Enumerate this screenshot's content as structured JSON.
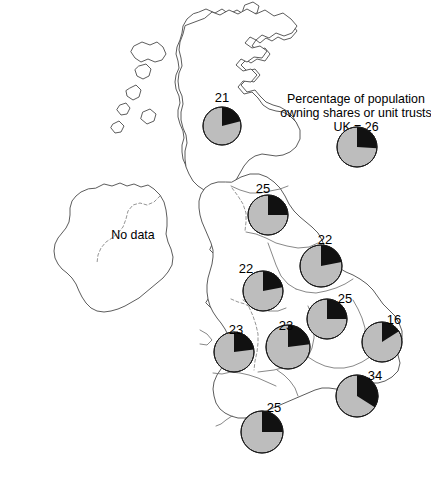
{
  "figure": {
    "title_line1": "Percentage of population",
    "title_line2": "owning shares or unit trusts",
    "title_line3": "UK = 26",
    "no_data_label": "No data",
    "colors": {
      "owners_wedge": "#111111",
      "non_owners_wedge": "#bdbdbd",
      "coastline": "#4a4a4a",
      "region_boundary": "#6a6a6a",
      "background": "#ffffff"
    }
  },
  "chart_data": {
    "type": "pie",
    "title": "Percentage of population owning shares or unit trusts",
    "subtitle": "UK = 26",
    "value_unit": "percent",
    "series_name": "Owning shares or unit trusts",
    "categories": [
      "Owning shares or unit trusts",
      "Not owning"
    ],
    "national_reference": {
      "name": "UK",
      "value": 26,
      "remainder": 74,
      "label": "UK = 26"
    },
    "regions": [
      {
        "name": "Scotland",
        "value": 21,
        "remainder": 79,
        "label": "21",
        "cx": 222,
        "cy": 126,
        "r": 19,
        "label_x": 222,
        "label_y": 102
      },
      {
        "name": "North East",
        "value": 25,
        "remainder": 75,
        "label": "25",
        "cx": 268,
        "cy": 215,
        "r": 20,
        "label_x": 263,
        "label_y": 193
      },
      {
        "name": "Yorkshire and the Humber",
        "value": 22,
        "remainder": 78,
        "label": "22",
        "cx": 321,
        "cy": 266,
        "r": 21,
        "label_x": 325,
        "label_y": 244
      },
      {
        "name": "North West",
        "value": 22,
        "remainder": 78,
        "label": "22",
        "cx": 263,
        "cy": 291,
        "r": 20,
        "label_x": 246,
        "label_y": 273
      },
      {
        "name": "East Midlands",
        "value": 25,
        "remainder": 75,
        "label": "25",
        "cx": 327,
        "cy": 319,
        "r": 20,
        "label_x": 345,
        "label_y": 303
      },
      {
        "name": "East of England",
        "value": 16,
        "remainder": 84,
        "label": "16",
        "cx": 382,
        "cy": 342,
        "r": 20,
        "label_x": 394,
        "label_y": 324
      },
      {
        "name": "Wales",
        "value": 23,
        "remainder": 77,
        "label": "23",
        "cx": 234,
        "cy": 352,
        "r": 20,
        "label_x": 236,
        "label_y": 334
      },
      {
        "name": "West Midlands",
        "value": 23,
        "remainder": 77,
        "label": "23",
        "cx": 288,
        "cy": 347,
        "r": 22,
        "label_x": 286,
        "label_y": 330
      },
      {
        "name": "London and South East",
        "value": 34,
        "remainder": 66,
        "label": "34",
        "cx": 357,
        "cy": 396,
        "r": 21,
        "label_x": 375,
        "label_y": 380
      },
      {
        "name": "South West",
        "value": 25,
        "remainder": 75,
        "label": "25",
        "cx": 262,
        "cy": 432,
        "r": 21,
        "label_x": 274,
        "label_y": 412
      }
    ],
    "excluded_region": {
      "name": "Ireland",
      "label": "No data",
      "x": 133,
      "y": 234
    },
    "legend": {
      "cx": 357,
      "cy": 147,
      "r": 20,
      "value": 26
    },
    "legend_position": "top-right",
    "grid": false
  }
}
